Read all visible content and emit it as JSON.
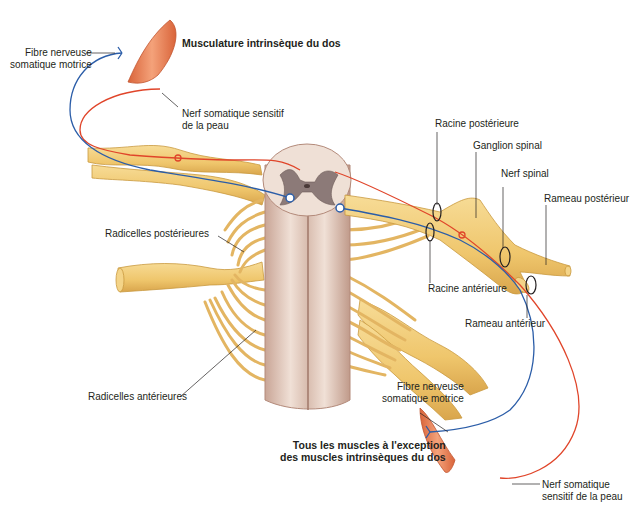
{
  "diagram": {
    "colors": {
      "nerve_fill": "#f2cd7a",
      "nerve_stroke": "#c9993f",
      "cord_fill": "#ead3c7",
      "cord_stroke": "#b38a7a",
      "grey_matter": "#8c7a78",
      "sensory_fiber": "#e0452a",
      "motor_fiber": "#2b5da8",
      "muscle": "#e8834f",
      "leader_line": "#231f20"
    },
    "labels": {
      "top_muscle_title": "Musculature intrinsèque du dos",
      "fibre_motrice_top": [
        "Fibre nerveuse",
        "somatique motrice"
      ],
      "nerf_sensitif_top": [
        "Nerf somatique sensitif",
        "de la peau"
      ],
      "racine_posterieure": "Racine postérieure",
      "ganglion_spinal": "Ganglion spinal",
      "nerf_spinal": "Nerf spinal",
      "rameau_posterieur": "Rameau postérieur",
      "radicelles_posterieures": "Radicelles postérieures",
      "racine_anterieure": "Racine antérieure",
      "rameau_anterieur": "Rameau antérieur",
      "radicelles_anterieures": "Radicelles antérieures",
      "fibre_motrice_bottom": [
        "Fibre nerveuse",
        "somatique motrice"
      ],
      "bottom_muscle_title": [
        "Tous les muscles à l'exception",
        "des muscles intrinsèques du dos"
      ],
      "nerf_sensitif_bottom": [
        "Nerf somatique",
        "sensitif de la peau"
      ]
    }
  }
}
